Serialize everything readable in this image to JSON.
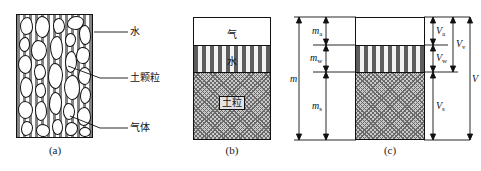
{
  "figure": {
    "captions": {
      "a": "(a)",
      "b": "(b)",
      "c": "(c)"
    }
  },
  "panel_a": {
    "name": "real soil structure",
    "labels": {
      "water": "水",
      "soil_particle": "土颗粒",
      "gas": "气体"
    }
  },
  "panel_b": {
    "name": "idealized three phase block",
    "layers": {
      "air": "气",
      "water": "水",
      "solid": "土粒"
    }
  },
  "panel_c": {
    "name": "three phase block with mass and volume dimensions",
    "mass": {
      "total": "m",
      "air": "m",
      "air_sub": "a",
      "water": "m",
      "water_sub": "w",
      "solid": "m",
      "solid_sub": "s"
    },
    "volume": {
      "total": "V",
      "air": "V",
      "air_sub": "a",
      "water": "V",
      "water_sub": "w",
      "void": "V",
      "void_sub": "v",
      "solid": "V",
      "solid_sub": "s"
    }
  },
  "colors": {
    "outline": "#111111",
    "solid_fill": "#c9c9c9",
    "water_fill": "#f3f3f3",
    "air_fill": "#ffffff"
  }
}
